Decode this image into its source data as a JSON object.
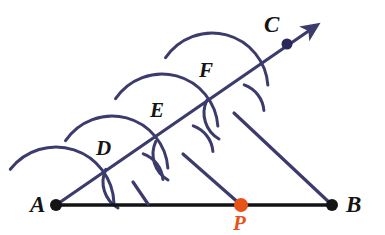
{
  "figure": {
    "width": 385,
    "height": 235,
    "background": "#ffffff"
  },
  "colors": {
    "ink_navy": "#3b3b6d",
    "ink_black": "#141414",
    "accent_orange": "#E8531A",
    "paper": "#ffffff"
  },
  "labels": {
    "a": "A",
    "b": "B",
    "c": "C",
    "d": "D",
    "e": "E",
    "f": "F",
    "p": "P"
  },
  "points": [
    {
      "name": "A",
      "label": "A",
      "x": 56,
      "y": 205,
      "dot": true,
      "dot_color": "#141414",
      "dot_r": 6.0,
      "label_x": 30,
      "label_y": 212
    },
    {
      "name": "B",
      "label": "B",
      "x": 332,
      "y": 205,
      "dot": true,
      "dot_color": "#141414",
      "dot_r": 6.0,
      "label_x": 346,
      "label_y": 212
    },
    {
      "name": "C",
      "label": "C",
      "x": 287,
      "y": 44,
      "dot": true,
      "dot_color": "#28285c",
      "dot_r": 5.5,
      "label_x": 264,
      "label_y": 32
    },
    {
      "name": "D",
      "label": "D",
      "x": 112,
      "y": 172,
      "dot": false,
      "dot_color": "#3b3b6d",
      "dot_r": 0,
      "label_x": 96,
      "label_y": 155
    },
    {
      "name": "E",
      "label": "E",
      "x": 162,
      "y": 130,
      "dot": false,
      "dot_color": "#3b3b6d",
      "dot_r": 0,
      "label_x": 150,
      "label_y": 117
    },
    {
      "name": "F",
      "label": "F",
      "x": 212,
      "y": 89,
      "dot": false,
      "dot_color": "#3b3b6d",
      "dot_r": 0,
      "label_x": 199,
      "label_y": 77
    },
    {
      "name": "P",
      "label": "P",
      "x": 241,
      "y": 205,
      "dot": true,
      "dot_color": "#E8531A",
      "dot_r": 7.0,
      "label_x": 233,
      "label_y": 230
    }
  ],
  "segments": [
    {
      "name": "segment-AB",
      "from": "A",
      "to": "B",
      "x1": 56,
      "y1": 205,
      "x2": 332,
      "y2": 205,
      "color": "#141414",
      "width": 3.4
    },
    {
      "name": "ray-AC",
      "from": "A",
      "to": "arrow-tip",
      "x1": 56,
      "y1": 205,
      "x2": 310,
      "y2": 30,
      "color": "#3b3b6d",
      "width": 3.2,
      "arrow": true
    },
    {
      "name": "transversal-B-to-F-mark",
      "from": "B",
      "to": "arc-cross-3",
      "x1": 332,
      "y1": 205,
      "x2": 234,
      "y2": 113,
      "color": "#3b3b6d",
      "width": 3.2
    },
    {
      "name": "parallel-P-to-E-mark",
      "from": "P",
      "to": "arc-cross-2",
      "x1": 241,
      "y1": 205,
      "x2": 183,
      "y2": 154,
      "color": "#3b3b6d",
      "width": 3.2
    },
    {
      "name": "parallel-foot-to-D-mark",
      "from": "arc-cross-1",
      "to": "AB",
      "x1": 133,
      "y1": 182,
      "x2": 148,
      "y2": 204,
      "color": "#3b3b6d",
      "width": 3.2
    }
  ],
  "arc_crossings": [
    {
      "name": "arc-cross-1",
      "x": 133,
      "y": 182
    },
    {
      "name": "arc-cross-2",
      "x": 183,
      "y": 154
    },
    {
      "name": "arc-cross-3",
      "x": 234,
      "y": 113
    }
  ],
  "arcs": [
    {
      "name": "arc-center-A",
      "cx": 56,
      "cy": 205,
      "r": 58,
      "start_deg": 218,
      "end_deg": 358,
      "color": "#3b3b6d",
      "width": 3.0
    },
    {
      "name": "arc-center-D",
      "cx": 112,
      "cy": 172,
      "r": 56,
      "start_deg": 214,
      "end_deg": 356,
      "color": "#3b3b6d",
      "width": 3.0
    },
    {
      "name": "arc-center-E",
      "cx": 162,
      "cy": 130,
      "r": 56,
      "start_deg": 214,
      "end_deg": 356,
      "color": "#3b3b6d",
      "width": 3.0
    },
    {
      "name": "arc-center-F",
      "cx": 212,
      "cy": 89,
      "r": 56,
      "start_deg": 214,
      "end_deg": 356,
      "color": "#3b3b6d",
      "width": 3.0
    }
  ],
  "tick_arcs": [
    {
      "name": "tick-arc-a1",
      "cx": 133,
      "cy": 182,
      "r": 30,
      "start_deg": 120,
      "end_deg": 205,
      "color": "#3b3b6d",
      "width": 3.0
    },
    {
      "name": "tick-arc-a2",
      "cx": 133,
      "cy": 182,
      "r": 30,
      "start_deg": 290,
      "end_deg": 355,
      "color": "#3b3b6d",
      "width": 3.0
    },
    {
      "name": "tick-arc-b1",
      "cx": 183,
      "cy": 154,
      "r": 30,
      "start_deg": 120,
      "end_deg": 205,
      "color": "#3b3b6d",
      "width": 3.0
    },
    {
      "name": "tick-arc-b2",
      "cx": 183,
      "cy": 154,
      "r": 30,
      "start_deg": 290,
      "end_deg": 355,
      "color": "#3b3b6d",
      "width": 3.0
    },
    {
      "name": "tick-arc-c1",
      "cx": 234,
      "cy": 113,
      "r": 30,
      "start_deg": 120,
      "end_deg": 205,
      "color": "#3b3b6d",
      "width": 3.0
    },
    {
      "name": "tick-arc-c2",
      "cx": 234,
      "cy": 113,
      "r": 30,
      "start_deg": 290,
      "end_deg": 355,
      "color": "#3b3b6d",
      "width": 3.0
    }
  ],
  "arrow": {
    "name": "ray-arrowhead",
    "tip_x": 313,
    "tip_y": 27,
    "color": "#3b3b6d"
  }
}
